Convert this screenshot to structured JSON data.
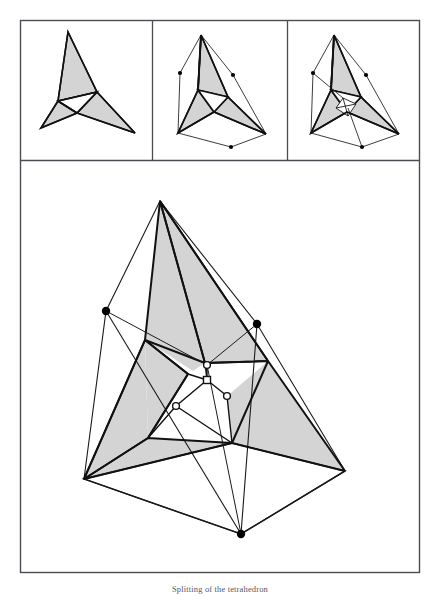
{
  "figure": {
    "caption": "Splitting of the tetrahedron",
    "border_color": "#4a4d52",
    "stroke_color": "#111111",
    "thin_stroke_color": "#1a1a1a",
    "fill_shaded": "#d4d4d4",
    "fill_white": "#ffffff",
    "dot_fill": "#000000",
    "open_marker_fill": "#ffffff",
    "frame": {
      "x": 20,
      "y": 20,
      "width": 400,
      "height": 553
    },
    "divider_y": 160,
    "divider_x1": 152,
    "divider_x2": 287,
    "panels": [
      {
        "name": "panel-flat",
        "label": "flat unfolded pinwheel",
        "shaded_triangles": [
          [
            [
              67,
              31
            ],
            [
              96,
              92
            ],
            [
              57,
              100
            ]
          ],
          [
            [
              96,
              92
            ],
            [
              57,
              100
            ],
            [
              40,
              127
            ]
          ],
          [
            [
              57,
              100
            ],
            [
              40,
              127
            ],
            [
              113,
              128
            ]
          ],
          [
            [
              96,
              92
            ],
            [
              113,
              128
            ],
            [
              134,
              133
            ]
          ]
        ],
        "outline_paths": [
          "M67,31 L96,92 L57,100 Z",
          "M57,100 L40,127 L76,113 Z",
          "M76,113 L113,128 L134,133 L96,92 Z",
          "M96,92 L76,113 L57,100 Z"
        ],
        "dots": []
      },
      {
        "name": "panel-partially-folded",
        "label": "partially folded",
        "dots": [
          [
            180,
            73
          ],
          [
            233,
            75
          ],
          [
            231,
            147
          ]
        ]
      },
      {
        "name": "panel-more-folded",
        "label": "further folded with inner detail",
        "dots": [
          [
            313,
            73
          ],
          [
            366,
            75
          ],
          [
            362,
            147
          ]
        ]
      }
    ],
    "main": {
      "name": "main-diagram",
      "apex": [
        160,
        201
      ],
      "base_left": [
        84,
        479
      ],
      "base_right": [
        345,
        471
      ],
      "base_front": [
        241,
        534
      ],
      "dot_left": [
        106,
        311
      ],
      "dot_right": [
        257,
        324
      ],
      "dot_bottom": [
        241,
        534
      ],
      "center_markers": [
        {
          "type": "circle",
          "x": 207,
          "y": 365
        },
        {
          "type": "square",
          "x": 207,
          "y": 380
        },
        {
          "type": "circle",
          "x": 176,
          "y": 406
        },
        {
          "type": "circle",
          "x": 227,
          "y": 396
        }
      ]
    }
  }
}
